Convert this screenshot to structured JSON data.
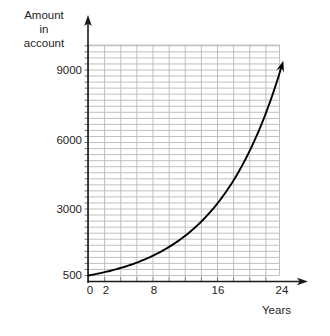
{
  "chart_data": {
    "type": "line",
    "title": "",
    "subtitle": "",
    "ylabel": "Amount\nin\naccount",
    "xlabel": "Years",
    "grid": true,
    "legend": false,
    "xlim": [
      0,
      26
    ],
    "ylim": [
      500,
      9500
    ],
    "xticks": [
      0,
      2,
      8,
      16,
      24
    ],
    "xtick_labels": [
      "0",
      "2",
      "8",
      "16",
      "24"
    ],
    "yticks": [
      500,
      3000,
      6000,
      9000
    ],
    "ytick_labels": [
      "500",
      "3000",
      "6000",
      "9000"
    ],
    "x_grid_step": 2,
    "y_grid_step": 250,
    "series": [
      {
        "name": "Amount in account",
        "x": [
          0,
          2,
          4,
          6,
          8,
          10,
          12,
          14,
          16,
          18,
          20,
          22,
          24
        ],
        "values": [
          500,
          640,
          820,
          1050,
          1340,
          1720,
          2200,
          2820,
          3600,
          4620,
          5900,
          7200,
          9200
        ]
      }
    ],
    "annotations": [
      "arrowhead at curve end",
      "arrowhead on x-axis",
      "arrowhead on y-axis"
    ]
  },
  "axes": {
    "y_title": "Amount\nin\naccount",
    "x_title": "Years"
  },
  "y_ticks": [
    {
      "label": "9000",
      "top": 64
    },
    {
      "label": "6000",
      "top": 134
    },
    {
      "label": "3000",
      "top": 203
    },
    {
      "label": "500",
      "top": 269
    }
  ],
  "x_ticks": [
    {
      "label": "0",
      "left": 78
    },
    {
      "label": "2",
      "left": 94
    },
    {
      "label": "8",
      "left": 142
    },
    {
      "label": "16",
      "left": 206
    },
    {
      "label": "24",
      "left": 270
    }
  ],
  "colors": {
    "grid": "#b9b9b9",
    "grid_major": "#8f8f8f",
    "axis": "#1a1a1a",
    "curve": "#000000",
    "background": "#ffffff"
  }
}
